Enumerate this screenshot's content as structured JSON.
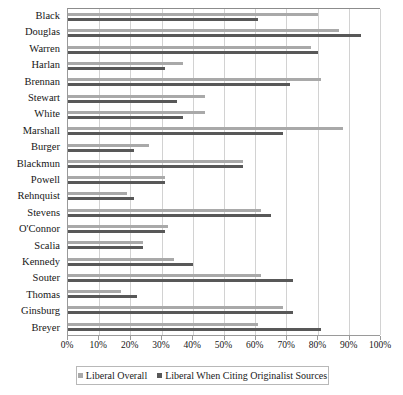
{
  "chart_data": {
    "type": "bar",
    "orientation": "horizontal",
    "title": "",
    "subtitle": "",
    "xlabel": "",
    "ylabel": "",
    "xlim": [
      0,
      100
    ],
    "grid": true,
    "legend_position": "bottom",
    "xtick_labels": [
      "0%",
      "10%",
      "20%",
      "30%",
      "40%",
      "50%",
      "60%",
      "70%",
      "80%",
      "90%",
      "100%"
    ],
    "xtick_values": [
      0,
      10,
      20,
      30,
      40,
      50,
      60,
      70,
      80,
      90,
      100
    ],
    "categories": [
      "Black",
      "Douglas",
      "Warren",
      "Harlan",
      "Brennan",
      "Stewart",
      "White",
      "Marshall",
      "Burger",
      "Blackmun",
      "Powell",
      "Rehnquist",
      "Stevens",
      "O'Connor",
      "Scalia",
      "Kennedy",
      "Souter",
      "Thomas",
      "Ginsburg",
      "Breyer"
    ],
    "series": [
      {
        "name": "Liberal Overall",
        "color": "#a9a9a9",
        "values": [
          80,
          87,
          78,
          37,
          81,
          44,
          44,
          88,
          26,
          56,
          31,
          19,
          62,
          32,
          24,
          34,
          62,
          17,
          69,
          61
        ]
      },
      {
        "name": "Liberal When Citing Originalist Sources",
        "color": "#585858",
        "values": [
          61,
          94,
          80,
          31,
          71,
          35,
          37,
          69,
          21,
          56,
          31,
          21,
          65,
          31,
          24,
          40,
          72,
          22,
          72,
          81
        ]
      }
    ]
  },
  "legend": {
    "entries": [
      {
        "label": "Liberal Overall"
      },
      {
        "label": "Liberal When Citing Originalist Sources"
      }
    ]
  }
}
